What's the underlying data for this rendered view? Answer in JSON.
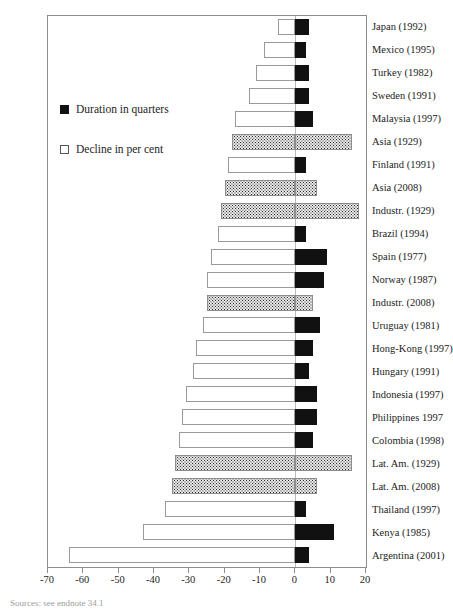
{
  "legend": {
    "duration_label": "Duration in quarters",
    "decline_label": "Decline in per cent",
    "duration_color": "#111111",
    "decline_color": "#ffffff"
  },
  "axis": {
    "ticks": [
      "-70",
      "-60",
      "-50",
      "-40",
      "-30",
      "-20",
      "-10",
      "0",
      "10",
      "20"
    ],
    "min": -70,
    "max": 20
  },
  "footnote": "Sources: see endnote 34.1",
  "chart_data": {
    "type": "bar",
    "title": "",
    "xlabel": "",
    "ylabel": "",
    "xlim": [
      -70,
      20
    ],
    "grid": false,
    "legend_position": "inside-left",
    "orientation": "horizontal",
    "categories": [
      "Japan (1992)",
      "Mexico (1995)",
      "Turkey (1982)",
      "Sweden (1991)",
      "Malaysia (1997)",
      "Asia (1929)",
      "Finland (1991)",
      "Asia (2008)",
      "Industr. (1929)",
      "Brazil (1994)",
      "Spain (1977)",
      "Norway (1987)",
      "Industr. (2008)",
      "Uruguay (1981)",
      "Hong-Kong (1997)",
      "Hungary (1991)",
      "Indonesia (1997)",
      "Philippines 1997",
      "Colombia (1998)",
      "Lat. Am. (1929)",
      "Lat. Am. (2008)",
      "Thailand (1997)",
      "Kenya (1985)",
      "Argentina (2001)"
    ],
    "series": [
      {
        "name": "Decline in per cent",
        "style": "white",
        "values": [
          -5,
          -9,
          -11,
          -13,
          -17,
          -18,
          -19,
          -20,
          -21,
          -22,
          -24,
          -25,
          -25,
          -26,
          -28,
          -29,
          -31,
          -32,
          -33,
          -34,
          -35,
          -37,
          -43,
          -64
        ]
      },
      {
        "name": "Duration in quarters",
        "style": "black",
        "values": [
          4,
          3,
          4,
          4,
          5,
          16,
          3,
          6,
          18,
          3,
          9,
          8,
          5,
          7,
          5,
          4,
          6,
          6,
          5,
          16,
          6,
          3,
          11,
          4
        ]
      }
    ],
    "dotted_rows": [
      "Asia (1929)",
      "Asia (2008)",
      "Industr. (1929)",
      "Industr. (2008)",
      "Lat. Am. (1929)",
      "Lat. Am. (2008)"
    ]
  }
}
